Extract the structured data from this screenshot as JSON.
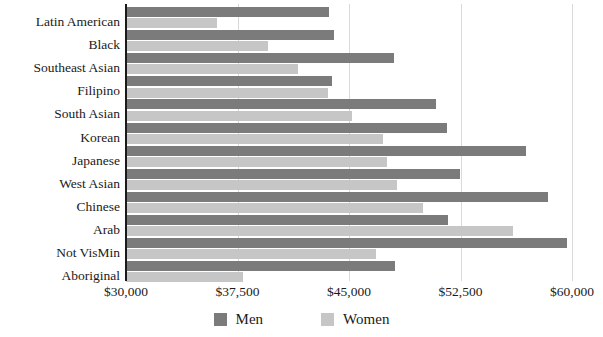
{
  "chart_data": {
    "type": "bar",
    "orientation": "horizontal",
    "title": "",
    "xlabel": "",
    "ylabel": "",
    "xlim": [
      30000,
      60000
    ],
    "xticks": [
      30000,
      37500,
      45000,
      52500,
      60000
    ],
    "xtick_labels": [
      "$30,000",
      "$37,500",
      "$45,000",
      "$52,500",
      "$60,000"
    ],
    "grid": true,
    "legend_position": "bottom",
    "categories": [
      "Latin American",
      "Black",
      "Southeast Asian",
      "Filipino",
      "South Asian",
      "Korean",
      "Japanese",
      "West Asian",
      "Chinese",
      "Arab",
      "Not VisMin",
      "Aboriginal"
    ],
    "series": [
      {
        "name": "Men",
        "color": "#7b7b7b",
        "values": [
          43650,
          43990,
          48030,
          43850,
          50840,
          51600,
          56900,
          52470,
          58370,
          51660,
          59660,
          48100
        ]
      },
      {
        "name": "Women",
        "color": "#c6c6c6",
        "values": [
          36120,
          39550,
          41570,
          43580,
          45200,
          47280,
          47550,
          48230,
          49970,
          56030,
          46800,
          37870
        ]
      }
    ]
  },
  "legend": {
    "items": [
      {
        "label": "Men",
        "swatch": "men-swatch",
        "color": "#7b7b7b"
      },
      {
        "label": "Women",
        "swatch": "women-swatch",
        "color": "#c6c6c6"
      }
    ]
  }
}
